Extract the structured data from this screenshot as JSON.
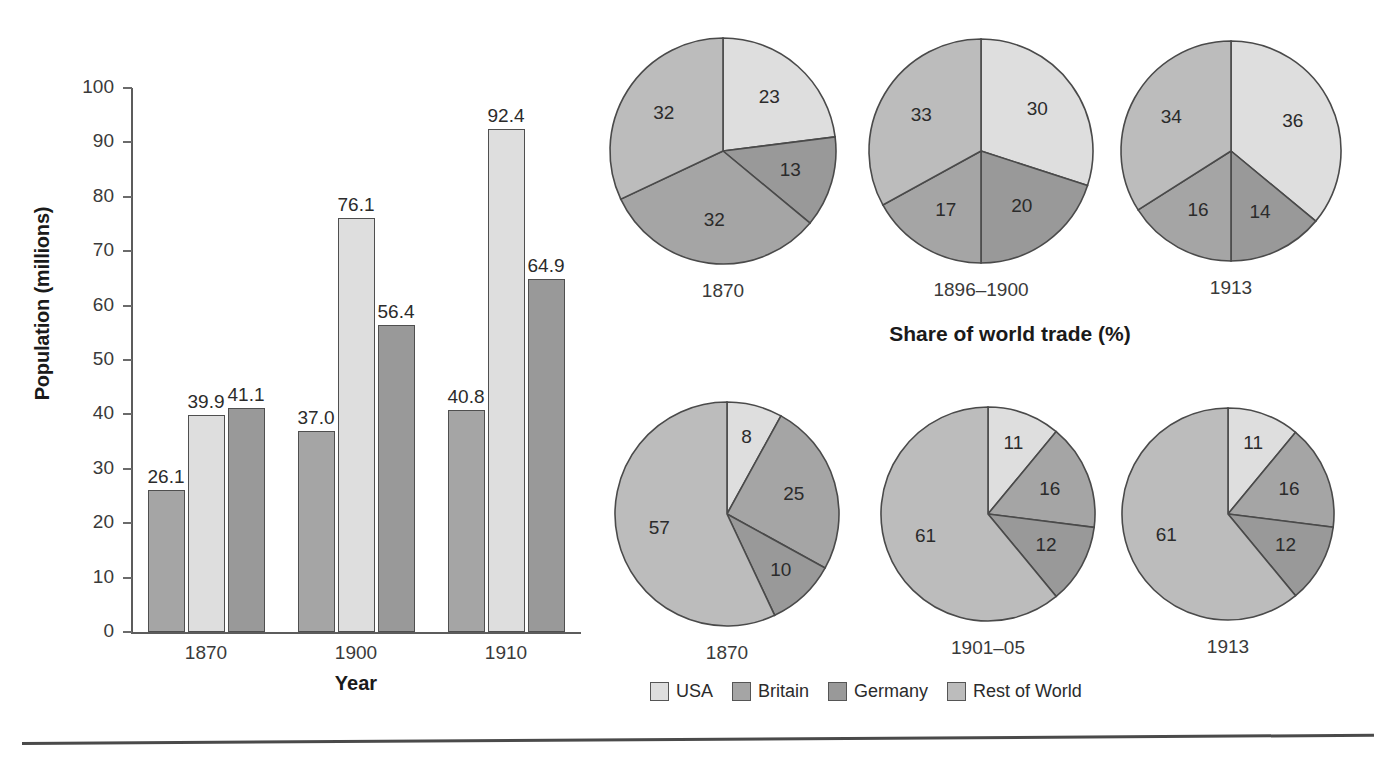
{
  "figure": {
    "pies_title": "Share of world trade (%)"
  },
  "legend": {
    "items": [
      {
        "label": "USA",
        "color": "#dedede"
      },
      {
        "label": "Britain",
        "color": "#a5a5a5"
      },
      {
        "label": "Germany",
        "color": "#999999"
      },
      {
        "label": "Rest of World",
        "color": "#bcbcbc"
      }
    ]
  },
  "chart_data": [
    {
      "type": "bar",
      "title": "",
      "xlabel": "Year",
      "ylabel": "Population (millions)",
      "ylim": [
        0,
        100
      ],
      "yticks": [
        0,
        10,
        20,
        30,
        40,
        50,
        60,
        70,
        80,
        90,
        100
      ],
      "ytick_labels": [
        "0",
        "10",
        "20",
        "30",
        "40",
        "50",
        "60",
        "70",
        "80",
        "90",
        "100"
      ],
      "grid": false,
      "legend_position": "bottom",
      "categories": [
        "1870",
        "1900",
        "1910"
      ],
      "series": [
        {
          "name": "Britain",
          "color": "#a5a5a5",
          "values": [
            26.1,
            37.0,
            40.8
          ],
          "labels": [
            "26.1",
            "37.0",
            "40.8"
          ]
        },
        {
          "name": "USA",
          "color": "#dedede",
          "values": [
            39.9,
            76.1,
            92.4
          ],
          "labels": [
            "39.9",
            "76.1",
            "92.4"
          ]
        },
        {
          "name": "Germany",
          "color": "#999999",
          "values": [
            41.1,
            56.4,
            64.9
          ],
          "labels": [
            "41.1",
            "56.4",
            "64.9"
          ]
        }
      ]
    },
    {
      "type": "pie",
      "title": "",
      "label": "1870",
      "row": "top",
      "labels": [
        "USA",
        "Germany",
        "Britain",
        "Rest of World"
      ],
      "values": [
        23,
        13,
        32,
        32
      ],
      "display": [
        "23",
        "13",
        "32",
        "32"
      ],
      "colors": [
        "#dedede",
        "#999999",
        "#a5a5a5",
        "#bcbcbc"
      ]
    },
    {
      "type": "pie",
      "title": "",
      "label": "1896–1900",
      "row": "top",
      "labels": [
        "USA",
        "Germany",
        "Britain",
        "Rest of World"
      ],
      "values": [
        30,
        20,
        17,
        33
      ],
      "display": [
        "30",
        "20",
        "17",
        "33"
      ],
      "colors": [
        "#dedede",
        "#999999",
        "#a5a5a5",
        "#bcbcbc"
      ]
    },
    {
      "type": "pie",
      "title": "",
      "label": "1913",
      "row": "top",
      "labels": [
        "USA",
        "Germany",
        "Britain",
        "Rest of World"
      ],
      "values": [
        36,
        14,
        16,
        34
      ],
      "display": [
        "36",
        "14",
        "16",
        "34"
      ],
      "colors": [
        "#dedede",
        "#999999",
        "#a5a5a5",
        "#bcbcbc"
      ]
    },
    {
      "type": "pie",
      "title": "",
      "label": "1870",
      "row": "bottom",
      "labels": [
        "USA",
        "Britain",
        "Germany",
        "Rest of World"
      ],
      "values": [
        8,
        25,
        10,
        57
      ],
      "display": [
        "8",
        "25",
        "10",
        "57"
      ],
      "colors": [
        "#dedede",
        "#a5a5a5",
        "#999999",
        "#bcbcbc"
      ]
    },
    {
      "type": "pie",
      "title": "",
      "label": "1901–05",
      "row": "bottom",
      "labels": [
        "USA",
        "Britain",
        "Germany",
        "Rest of World"
      ],
      "values": [
        11,
        16,
        12,
        61
      ],
      "display": [
        "11",
        "16",
        "12",
        "61"
      ],
      "colors": [
        "#dedede",
        "#a5a5a5",
        "#999999",
        "#bcbcbc"
      ]
    },
    {
      "type": "pie",
      "title": "",
      "label": "1913",
      "row": "bottom",
      "labels": [
        "USA",
        "Britain",
        "Germany",
        "Rest of World"
      ],
      "values": [
        11,
        16,
        12,
        61
      ],
      "display": [
        "11",
        "16",
        "12",
        "61"
      ],
      "colors": [
        "#dedede",
        "#a5a5a5",
        "#999999",
        "#bcbcbc"
      ]
    }
  ]
}
